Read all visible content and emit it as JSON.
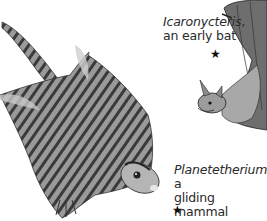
{
  "illustration": {
    "subjects": [
      {
        "name": "Icaronycteris",
        "caption_italic": "Icaronycteris",
        "caption_suffix": ",",
        "caption_line2": "an early bat",
        "icon": "bat-illustration"
      },
      {
        "name": "Planetetherium",
        "caption_italic": "Planetetherium",
        "caption_suffix": ", a",
        "caption_line2": "gliding mammal",
        "icon": "gliding-mammal-illustration"
      }
    ],
    "marker_glyph": "★",
    "colors": {
      "background": "#ffffff",
      "text": "#2a2a2a",
      "ink": "#1a1a1a",
      "fur_mid": "#8a8a8a",
      "fur_light": "#c8c8c8"
    }
  }
}
